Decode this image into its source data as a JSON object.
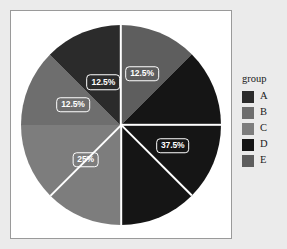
{
  "chart_data": {
    "type": "pie",
    "title": "",
    "legend_title": "group",
    "legend_position": "right",
    "categories": [
      "A",
      "B",
      "C",
      "D",
      "E"
    ],
    "values": [
      12.5,
      12.5,
      12.5,
      25,
      37.5
    ],
    "labels": [
      "12.5%",
      "12.5%",
      "12.5%",
      "25%",
      "37.5%"
    ],
    "colors": [
      "#2b2b2b",
      "#6e6e6e",
      "#7d7d7d",
      "#151515",
      "#5e5e5e"
    ],
    "slices": [
      {
        "category": "E",
        "value": 12.5,
        "label": "12.5%",
        "color": "#5e5e5e",
        "start_deg": 0,
        "end_deg": 45
      },
      {
        "category": "D",
        "value": 37.5,
        "label": "37.5%",
        "color": "#151515",
        "start_deg": 45,
        "end_deg": 180
      },
      {
        "category": "C",
        "value": 25,
        "label": "25%",
        "color": "#7d7d7d",
        "start_deg": 180,
        "end_deg": 270
      },
      {
        "category": "B",
        "value": 12.5,
        "label": "12.5%",
        "color": "#6e6e6e",
        "start_deg": 270,
        "end_deg": 315
      },
      {
        "category": "A",
        "value": 12.5,
        "label": "12.5%",
        "color": "#2b2b2b",
        "start_deg": 315,
        "end_deg": 360
      }
    ],
    "slice_border_color": "#ffffff",
    "label_text_color": "#ffffff",
    "panel_background": "#ffffff",
    "grid": false
  },
  "legend": {
    "title": "group",
    "items": [
      {
        "label": "A",
        "color": "#2b2b2b"
      },
      {
        "label": "B",
        "color": "#6e6e6e"
      },
      {
        "label": "C",
        "color": "#7d7d7d"
      },
      {
        "label": "D",
        "color": "#151515"
      },
      {
        "label": "E",
        "color": "#5e5e5e"
      }
    ]
  }
}
